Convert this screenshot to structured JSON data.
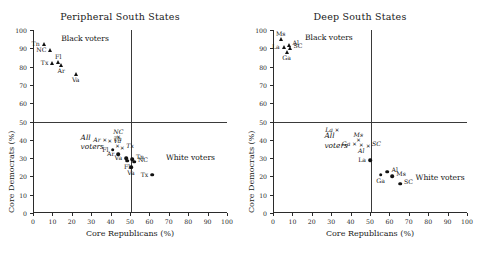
{
  "figure": {
    "width": 480,
    "height": 267,
    "background": "#ffffff",
    "ink_color": "#1a1a1a"
  },
  "chart_data": [
    {
      "type": "scatter",
      "title": "Peripheral South States",
      "xlabel": "Core Republicans (%)",
      "ylabel": "Core Democrats (%)",
      "xlim": [
        0,
        100
      ],
      "ylim": [
        0,
        100
      ],
      "xticks": [
        0,
        10,
        20,
        30,
        40,
        50,
        60,
        70,
        80,
        90,
        100
      ],
      "yticks": [
        0,
        10,
        20,
        30,
        40,
        50,
        60,
        70,
        80,
        90,
        100
      ],
      "grid": false,
      "legend": "none",
      "reference_lines": {
        "horizontal": 50,
        "vertical": 50
      },
      "annotations": [
        {
          "text": "Black voters",
          "x": 14,
          "y": 95,
          "style": "roman"
        },
        {
          "text": "White voters",
          "x": 68,
          "y": 30,
          "style": "roman"
        },
        {
          "text": "All",
          "x": 24,
          "y": 41,
          "style": "italic"
        },
        {
          "text": "voters",
          "x": 24,
          "y": 36,
          "style": "italic"
        }
      ],
      "series": [
        {
          "name": "Black voters",
          "marker": "triangle",
          "points": [
            {
              "label": "Tn",
              "x": 5.0,
              "y": 92.5,
              "label_pos": "left"
            },
            {
              "label": "NC",
              "x": 8.5,
              "y": 89.0,
              "label_pos": "left"
            },
            {
              "label": "Fl",
              "x": 12.5,
              "y": 82.5,
              "label_pos": "above"
            },
            {
              "label": "Tx",
              "x": 9.5,
              "y": 82.0,
              "label_pos": "left"
            },
            {
              "label": "Ar",
              "x": 14.0,
              "y": 81.0,
              "label_pos": "below"
            },
            {
              "label": "Va",
              "x": 21.5,
              "y": 76.0,
              "label_pos": "below"
            }
          ]
        },
        {
          "name": "All voters",
          "marker": "cross",
          "points": [
            {
              "label": "Ar",
              "x": 36.5,
              "y": 40.0,
              "label_pos": "left"
            },
            {
              "label": "Tn",
              "x": 39.0,
              "y": 39.5,
              "label_pos": "right"
            },
            {
              "label": "NC",
              "x": 43.5,
              "y": 41.5,
              "label_pos": "above"
            },
            {
              "label": "Va",
              "x": 43.0,
              "y": 36.5,
              "label_pos": "above"
            },
            {
              "label": "Tx",
              "x": 45.5,
              "y": 35.5,
              "label_pos": "right"
            }
          ]
        },
        {
          "name": "White voters",
          "marker": "circle",
          "points": [
            {
              "label": "Fl",
              "x": 40.5,
              "y": 34.5,
              "label_pos": "left"
            },
            {
              "label": "Ar",
              "x": 43.5,
              "y": 32.0,
              "label_pos": "left"
            },
            {
              "label": "Va",
              "x": 47.5,
              "y": 30.0,
              "label_pos": "left"
            },
            {
              "label": "Tn",
              "x": 50.5,
              "y": 29.5,
              "label_pos": "right"
            },
            {
              "label": "NC",
              "x": 51.5,
              "y": 28.0,
              "label_pos": "right"
            },
            {
              "label": "Fl",
              "x": 48.0,
              "y": 28.5,
              "label_pos": "below"
            },
            {
              "label": "Va",
              "x": 50.0,
              "y": 25.0,
              "label_pos": "below"
            },
            {
              "label": "Tx",
              "x": 61.0,
              "y": 21.0,
              "label_pos": "left"
            }
          ]
        }
      ]
    },
    {
      "type": "scatter",
      "title": "Deep South States",
      "xlabel": "Core Republicans (%)",
      "ylabel": "Core Democrats (%)",
      "xlim": [
        0,
        100
      ],
      "ylim": [
        0,
        100
      ],
      "xticks": [
        0,
        10,
        20,
        30,
        40,
        50,
        60,
        70,
        80,
        90,
        100
      ],
      "yticks": [
        0,
        10,
        20,
        30,
        40,
        50,
        60,
        70,
        80,
        90,
        100
      ],
      "grid": false,
      "legend": "none",
      "reference_lines": {
        "horizontal": 50,
        "vertical": 50
      },
      "annotations": [
        {
          "text": "Black voters",
          "x": 16,
          "y": 95.5,
          "style": "roman"
        },
        {
          "text": "White voters",
          "x": 73,
          "y": 19,
          "style": "roman"
        },
        {
          "text": "All",
          "x": 26,
          "y": 42,
          "style": "italic"
        },
        {
          "text": "voters",
          "x": 26,
          "y": 36.5,
          "style": "italic"
        }
      ],
      "series": [
        {
          "name": "Black voters",
          "marker": "triangle",
          "points": [
            {
              "label": "Ms",
              "x": 3.5,
              "y": 95.0,
              "label_pos": "above"
            },
            {
              "label": "Al",
              "x": 7.5,
              "y": 92.0,
              "label_pos": "right"
            },
            {
              "label": "SC",
              "x": 8.0,
              "y": 90.0,
              "label_pos": "right"
            },
            {
              "label": "La",
              "x": 5.0,
              "y": 90.5,
              "label_pos": "left"
            },
            {
              "label": "Ga",
              "x": 6.5,
              "y": 88.0,
              "label_pos": "below"
            }
          ]
        },
        {
          "name": "All voters",
          "marker": "cross",
          "points": [
            {
              "label": "La",
              "x": 32.5,
              "y": 45.5,
              "label_pos": "left"
            },
            {
              "label": "Ms",
              "x": 43.5,
              "y": 40.0,
              "label_pos": "above"
            },
            {
              "label": "Ga",
              "x": 41.5,
              "y": 37.5,
              "label_pos": "left"
            },
            {
              "label": "Al",
              "x": 45.0,
              "y": 37.0,
              "label_pos": "below"
            },
            {
              "label": "SC",
              "x": 48.5,
              "y": 36.5,
              "label_pos": "right"
            }
          ]
        },
        {
          "name": "White voters",
          "marker": "circle",
          "points": [
            {
              "label": "La",
              "x": 49.5,
              "y": 29.0,
              "label_pos": "left"
            },
            {
              "label": "Ga",
              "x": 55.0,
              "y": 21.0,
              "label_pos": "below"
            },
            {
              "label": "Al",
              "x": 58.5,
              "y": 22.5,
              "label_pos": "right"
            },
            {
              "label": "Ms",
              "x": 61.0,
              "y": 20.0,
              "label_pos": "right"
            },
            {
              "label": "SC",
              "x": 65.0,
              "y": 16.0,
              "label_pos": "right"
            }
          ]
        }
      ]
    }
  ]
}
